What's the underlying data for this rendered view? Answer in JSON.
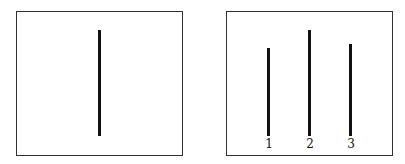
{
  "reference_panel": {
    "line": {
      "x": 99,
      "top": 30,
      "bottom": 136
    }
  },
  "comparison_panel": {
    "lines": [
      {
        "label": "1",
        "x": 268,
        "top": 48,
        "bottom": 136
      },
      {
        "label": "2",
        "x": 309,
        "top": 30,
        "bottom": 136
      },
      {
        "label": "3",
        "x": 350,
        "top": 44,
        "bottom": 136
      }
    ]
  }
}
